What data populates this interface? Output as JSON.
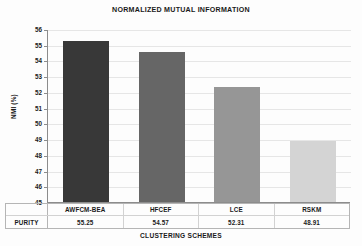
{
  "chart_data": {
    "type": "bar",
    "title": "NORMALIZED MUTUAL INFORMATION",
    "xlabel": "CLUSTERING SCHEMES",
    "ylabel": "NMI (%)",
    "categories": [
      "AWFCM-BEA",
      "HFCEF",
      "LCE",
      "RSKM"
    ],
    "values": [
      55.25,
      54.57,
      52.31,
      48.91
    ],
    "ylim": [
      45,
      56
    ],
    "ytick_labels": [
      "56",
      "55",
      "54",
      "53",
      "52",
      "51",
      "50",
      "49",
      "48",
      "47",
      "46",
      "45"
    ],
    "ytick_values": [
      56,
      55,
      54,
      53,
      52,
      51,
      50,
      49,
      48,
      47,
      46,
      45
    ],
    "grid": true,
    "legend": "none",
    "bar_colors": [
      "#383838",
      "#666666",
      "#969696",
      "#d4d4d4"
    ]
  },
  "table": {
    "row_label": "PURITY",
    "header_row": [
      "AWFCM-BEA",
      "HFCEF",
      "LCE",
      "RSKM"
    ],
    "value_row": [
      "55.25",
      "54.57",
      "52.31",
      "48.91"
    ]
  },
  "colors": {
    "axis": "#8c8c8c",
    "grid": "#e6e6e6",
    "text": "#1a1a1a",
    "table_border": "#b5b5b5",
    "background": "#fdfdfd"
  }
}
